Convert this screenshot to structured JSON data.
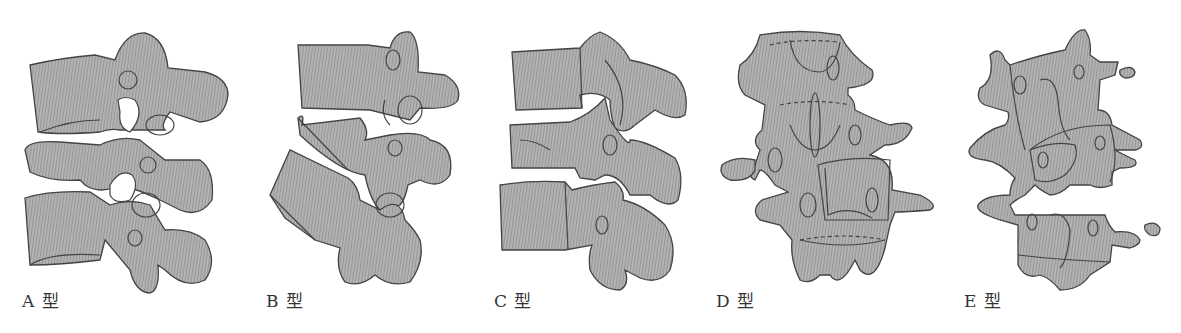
{
  "figure": {
    "colors": {
      "bone_fill": "#a6a6a6",
      "hatch_line": "#8a8a8a",
      "outline": "#444444",
      "background": "#ffffff"
    },
    "panels": [
      {
        "id": "A",
        "label": "A 型"
      },
      {
        "id": "B",
        "label": "B 型"
      },
      {
        "id": "C",
        "label": "C 型"
      },
      {
        "id": "D",
        "label": "D 型"
      },
      {
        "id": "E",
        "label": "E 型"
      }
    ]
  }
}
